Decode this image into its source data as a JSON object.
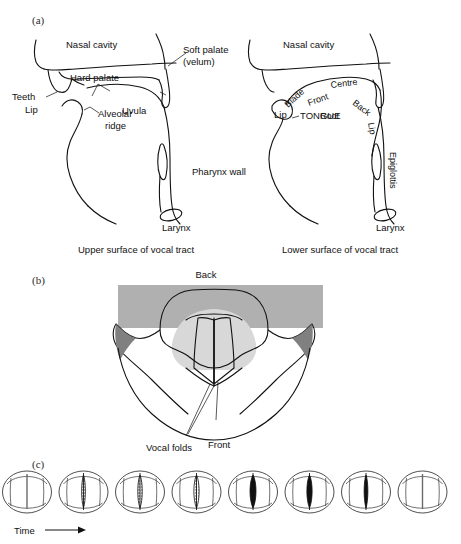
{
  "figure": {
    "panels": [
      {
        "id": "a",
        "label": "(a)"
      },
      {
        "id": "b",
        "label": "(b)"
      },
      {
        "id": "c",
        "label": "(c)"
      }
    ]
  },
  "panel_a": {
    "left_diagram": {
      "caption": "Upper surface of vocal tract",
      "labels": [
        {
          "name": "nasal-cavity",
          "text": "Nasal cavity"
        },
        {
          "name": "soft-palate",
          "text": "Soft palate"
        },
        {
          "name": "velum",
          "text": "(velum)"
        },
        {
          "name": "hard-palate",
          "text": "Hard palate"
        },
        {
          "name": "teeth",
          "text": "Teeth"
        },
        {
          "name": "uvula",
          "text": "Uvula"
        },
        {
          "name": "lip",
          "text": "Lip"
        },
        {
          "name": "alveolar",
          "text": "Alveolar"
        },
        {
          "name": "ridge",
          "text": "ridge"
        },
        {
          "name": "pharynx-wall",
          "text": "Pharynx wall"
        },
        {
          "name": "larynx",
          "text": "Larynx"
        }
      ]
    },
    "right_diagram": {
      "caption": "Lower surface of vocal tract",
      "labels": [
        {
          "name": "nasal-cavity",
          "text": "Nasal cavity"
        },
        {
          "name": "centre",
          "text": "Centre"
        },
        {
          "name": "blade",
          "text": "Blade"
        },
        {
          "name": "front",
          "text": "Front"
        },
        {
          "name": "back",
          "text": "Back"
        },
        {
          "name": "lip-outer",
          "text": "Lip"
        },
        {
          "name": "lip-inner",
          "text": "Lip"
        },
        {
          "name": "tongue",
          "text": "TONGUE"
        },
        {
          "name": "root",
          "text": "Root"
        },
        {
          "name": "epiglottis",
          "text": "Epiglottis"
        },
        {
          "name": "larynx",
          "text": "Larynx"
        }
      ]
    }
  },
  "panel_b": {
    "title_label": "Back",
    "bottom_labels": [
      {
        "name": "vocal-folds",
        "text": "Vocal folds"
      },
      {
        "name": "front",
        "text": "Front"
      }
    ],
    "colors": {
      "band_gray": "#b0b0b0",
      "inner_shade": "#d8d8d8",
      "outline": "#111111"
    }
  },
  "panel_c": {
    "axis_label": "Time",
    "arrow": "→",
    "frame_count": 8,
    "frames": [
      {
        "index": 1,
        "aperture": "closed",
        "width": 0,
        "fill": "none",
        "name": "glottis-frame-1"
      },
      {
        "index": 2,
        "aperture": "opening",
        "width": 5,
        "fill": "stipple",
        "name": "glottis-frame-2"
      },
      {
        "index": 3,
        "aperture": "opening",
        "width": 6,
        "fill": "stipple",
        "name": "glottis-frame-3"
      },
      {
        "index": 4,
        "aperture": "open",
        "width": 7,
        "fill": "stipple",
        "name": "glottis-frame-4"
      },
      {
        "index": 5,
        "aperture": "open",
        "width": 8,
        "fill": "solid",
        "name": "glottis-frame-5"
      },
      {
        "index": 6,
        "aperture": "closing",
        "width": 7,
        "fill": "solid",
        "name": "glottis-frame-6"
      },
      {
        "index": 7,
        "aperture": "closing",
        "width": 5,
        "fill": "solid",
        "name": "glottis-frame-7"
      },
      {
        "index": 8,
        "aperture": "closed",
        "width": 0,
        "fill": "none",
        "name": "glottis-frame-8"
      }
    ]
  }
}
